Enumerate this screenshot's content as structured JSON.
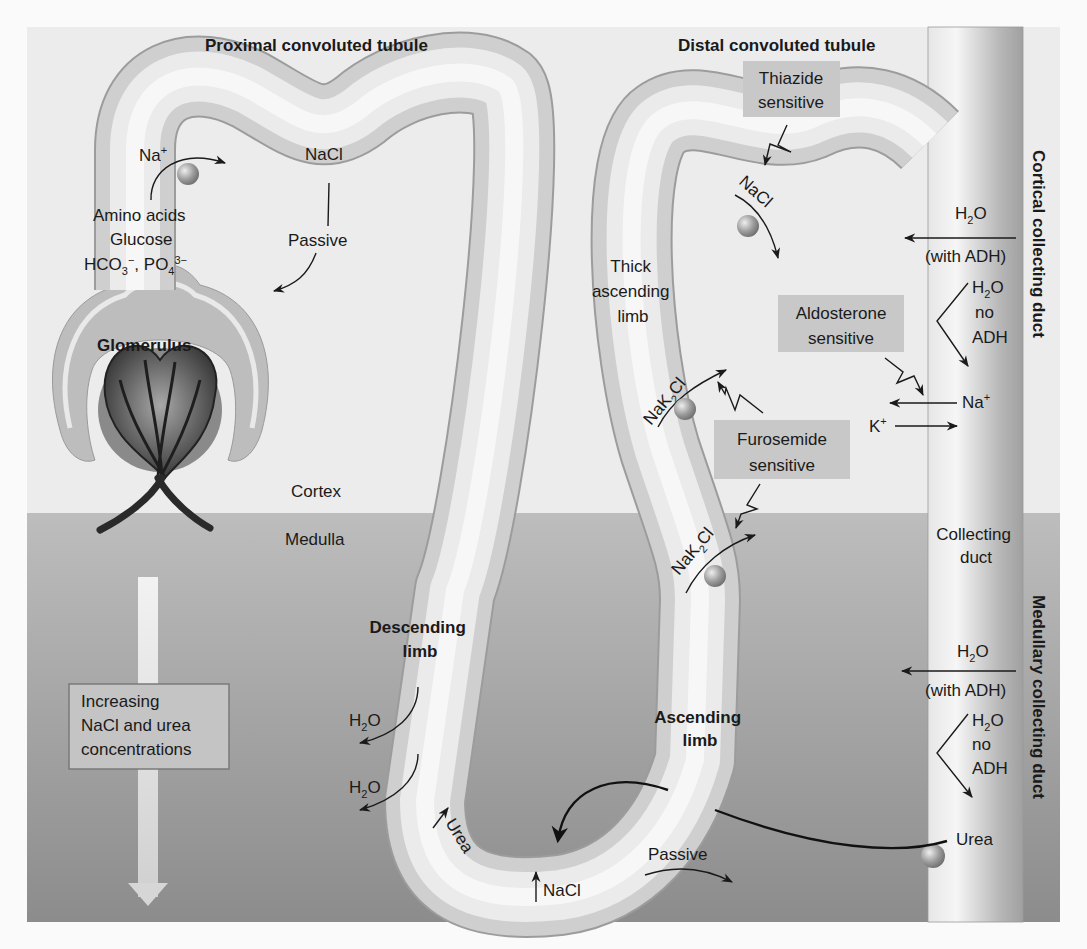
{
  "figure": {
    "regions": {
      "cortex_label": "Cortex",
      "medulla_label": "Medulla",
      "cortex_color": "#ececec",
      "medulla_color_top": "#b9b9b9",
      "medulla_color_bottom": "#8f8f8f",
      "border_color": "#fafafa"
    },
    "segments": {
      "proximal": "Proximal convoluted tubule",
      "distal": "Distal convoluted tubule",
      "glomerulus": "Glomerulus",
      "descending": [
        "Descending",
        "limb"
      ],
      "ascending": [
        "Ascending",
        "limb"
      ],
      "thick_ascending": [
        "Thick",
        "ascending",
        "limb"
      ],
      "collecting_duct": [
        "Collecting",
        "duct"
      ],
      "cortical_cd": "Cortical collecting duct",
      "medullary_cd": "Medullary collecting duct"
    },
    "pct_labels": {
      "na": "Na",
      "na_sup": "+",
      "amino": "Amino acids",
      "glucose": "Glucose",
      "hco": "HCO",
      "hco_sub": "3",
      "hco_sup": "−",
      "po": ", PO",
      "po_sub": "4",
      "po_sup": "3−",
      "nacl": "NaCl",
      "passive": "Passive"
    },
    "drug_boxes": {
      "thiazide": [
        "Thiazide",
        "sensitive"
      ],
      "aldosterone": [
        "Aldosterone",
        "sensitive"
      ],
      "furosemide": [
        "Furosemide",
        "sensitive"
      ],
      "box_color": "#c8c8c8"
    },
    "transport": {
      "dct_nacl": "NaCl",
      "nak2cl_a": "NaK",
      "nak2cl_sub": "2",
      "nak2cl_b": "Cl",
      "h2o": "H",
      "h2o_sub": "2",
      "h2o_o": "O",
      "with_adh": "(with ADH)",
      "no": "no",
      "adh": "ADH",
      "na": "Na",
      "na_sup": "+",
      "k": "K",
      "k_sup": "+",
      "urea": "Urea",
      "loop_urea": "Urea",
      "loop_nacl": "NaCl",
      "passive": "Passive"
    },
    "gradient_box": {
      "lines": [
        "Increasing",
        "NaCl and urea",
        "concentrations"
      ]
    }
  }
}
